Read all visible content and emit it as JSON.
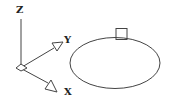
{
  "diagram": {
    "axes": {
      "z_label": "Z",
      "y_label": "Y",
      "x_label": "X"
    },
    "shapes": {
      "ellipse": {
        "cx": 115,
        "cy": 63,
        "rx": 45,
        "ry": 25.5
      },
      "grip_square": {
        "x": 116,
        "y": 28,
        "w": 11,
        "h": 11
      }
    },
    "colors": {
      "stroke": "#333333",
      "background": "#ffffff"
    }
  }
}
